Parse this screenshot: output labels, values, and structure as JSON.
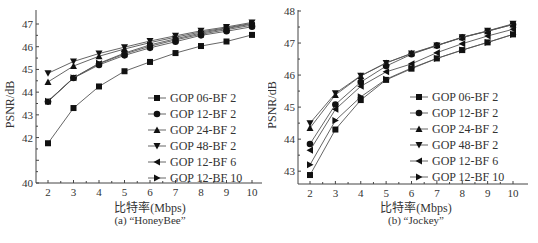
{
  "chart_data": [
    {
      "type": "line",
      "title": "(a) “HoneyBee”",
      "xlabel": "比特率(Mbps)",
      "ylabel": "PSNR/dB",
      "x": [
        2,
        3,
        4,
        5,
        6,
        7,
        8,
        9,
        10
      ],
      "xlim": [
        1.5,
        10.4
      ],
      "ylim": [
        40,
        47.5
      ],
      "yticks": [
        40,
        41,
        42,
        43,
        44,
        45,
        46,
        47
      ],
      "ytick_labels": [
        "40",
        "",
        "42",
        "43",
        "44",
        "45",
        "46",
        "47"
      ],
      "grid": false,
      "legend_position": "center-right",
      "series": [
        {
          "name": "GOP 06-BF 2",
          "marker": "square",
          "values": [
            41.75,
            43.3,
            44.25,
            44.92,
            45.33,
            45.72,
            46.03,
            46.23,
            46.52
          ]
        },
        {
          "name": "GOP 12-BF 2",
          "marker": "circle",
          "values": [
            43.58,
            44.62,
            45.2,
            45.62,
            45.95,
            46.22,
            46.5,
            46.68,
            46.88
          ]
        },
        {
          "name": "GOP 24-BF 2",
          "marker": "triangle-up",
          "values": [
            44.45,
            45.15,
            45.58,
            45.9,
            46.18,
            46.42,
            46.65,
            46.83,
            47.03
          ]
        },
        {
          "name": "GOP 48-BF 2",
          "marker": "triangle-down",
          "values": [
            44.83,
            45.35,
            45.7,
            45.98,
            46.25,
            46.48,
            46.7,
            46.87,
            47.07
          ]
        },
        {
          "name": "GOP 12-BF 6",
          "marker": "triangle-left",
          "values": [
            43.6,
            44.63,
            45.25,
            45.68,
            46.02,
            46.3,
            46.55,
            46.75,
            46.95
          ]
        },
        {
          "name": "GOP 12-BF 10",
          "marker": "triangle-right",
          "values": [
            43.6,
            44.63,
            45.27,
            45.72,
            46.08,
            46.35,
            46.6,
            46.8,
            47.0
          ]
        }
      ]
    },
    {
      "type": "line",
      "title": "(b) “Jockey”",
      "xlabel": "比特率(Mbps)",
      "ylabel": "PSNR/dB",
      "x": [
        2,
        3,
        4,
        5,
        6,
        7,
        8,
        9,
        10
      ],
      "xlim": [
        1.5,
        10.4
      ],
      "ylim": [
        42.6,
        48
      ],
      "yticks": [
        43,
        44,
        45,
        46,
        47,
        48
      ],
      "ytick_labels": [
        "43",
        "44",
        "45",
        "46",
        "47",
        "48"
      ],
      "grid": false,
      "legend_position": "center-right",
      "series": [
        {
          "name": "GOP 06-BF 2",
          "marker": "square",
          "values": [
            42.88,
            44.3,
            45.22,
            45.85,
            46.2,
            46.52,
            46.78,
            47.02,
            47.27
          ]
        },
        {
          "name": "GOP 12-BF 2",
          "marker": "circle",
          "values": [
            43.85,
            45.08,
            45.78,
            46.28,
            46.65,
            46.92,
            47.17,
            47.37,
            47.58
          ]
        },
        {
          "name": "GOP 24-BF 2",
          "marker": "triangle-up",
          "values": [
            44.35,
            45.38,
            45.97,
            46.38,
            46.68,
            46.93,
            47.18,
            47.37,
            47.58
          ]
        },
        {
          "name": "GOP 48-BF 2",
          "marker": "triangle-down",
          "values": [
            44.5,
            45.43,
            45.98,
            46.38,
            46.67,
            46.92,
            47.18,
            47.38,
            47.6
          ]
        },
        {
          "name": "GOP 12-BF 6",
          "marker": "triangle-left",
          "values": [
            43.65,
            44.93,
            45.65,
            46.1,
            46.35,
            46.7,
            46.98,
            47.22,
            47.43
          ]
        },
        {
          "name": "GOP 12-BF 10",
          "marker": "triangle-right",
          "values": [
            43.2,
            44.58,
            45.32,
            45.87,
            46.22,
            46.52,
            46.78,
            47.02,
            47.27
          ]
        }
      ]
    }
  ],
  "captions": {
    "left": "(a) “HoneyBee”",
    "right": "(b) “Jockey”",
    "xlabel": "比特率(Mbps)",
    "ylabel": "PSNR/dB"
  },
  "colors": {
    "line": "#555555",
    "marker": "#111111",
    "axis": "#444444"
  }
}
